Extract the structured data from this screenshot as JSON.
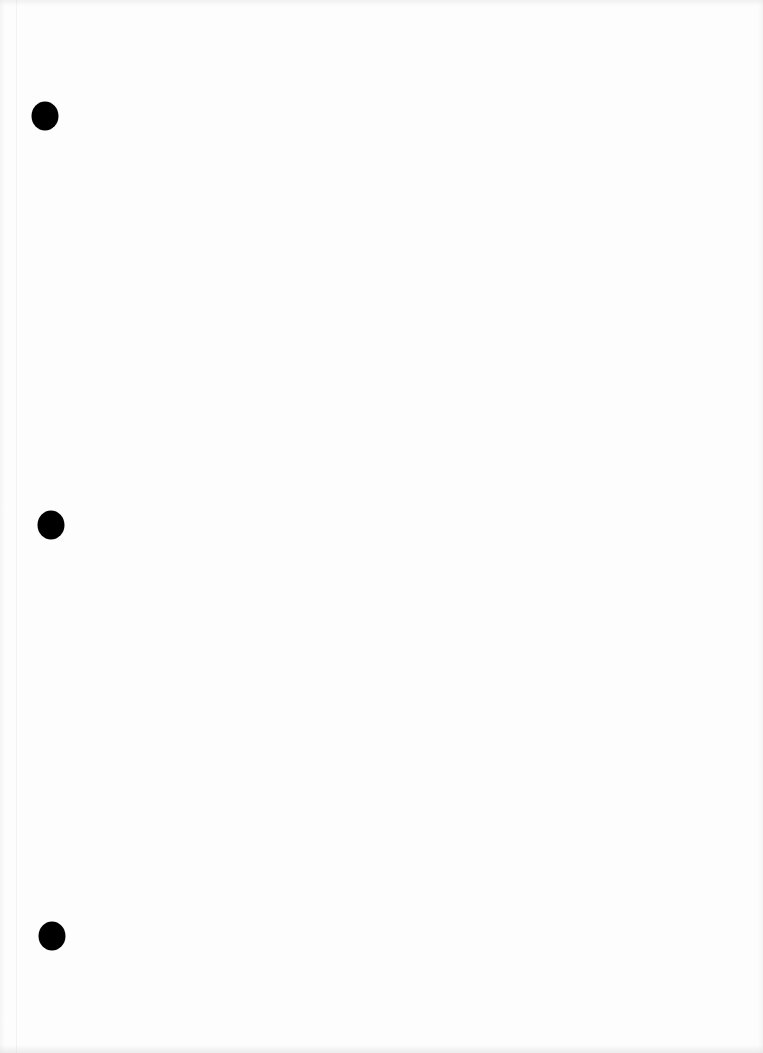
{
  "page": {
    "type": "blank-hole-punched-sheet",
    "background_color": "#fdfdfd",
    "text": ""
  },
  "punch_holes": [
    {
      "label": "top-hole",
      "cx": 45,
      "cy": 116,
      "color": "#000000"
    },
    {
      "label": "middle-hole",
      "cx": 51,
      "cy": 525,
      "color": "#000000"
    },
    {
      "label": "bottom-hole",
      "cx": 52,
      "cy": 936,
      "color": "#000000"
    }
  ]
}
